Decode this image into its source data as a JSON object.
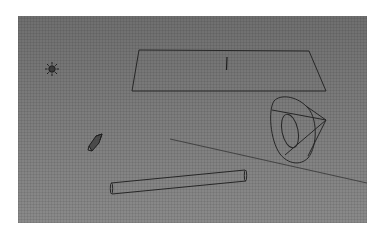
{
  "viewport": {
    "background": "#7c7c7c",
    "wire_color": "#2a2a2a",
    "objects": [
      {
        "name": "sun-lamp",
        "type": "light-sun",
        "center": [
          34,
          53
        ]
      },
      {
        "name": "plane",
        "type": "mesh-plane",
        "points": [
          [
            121,
            34
          ],
          [
            291,
            35
          ],
          [
            308,
            75
          ],
          [
            114,
            75
          ]
        ]
      },
      {
        "name": "spot-lamp",
        "type": "light-spot",
        "apex": [
          308,
          104
        ]
      },
      {
        "name": "camera",
        "type": "camera",
        "center": [
          76,
          126
        ]
      },
      {
        "name": "cylinder",
        "type": "mesh-cylinder",
        "from": [
          93,
          172
        ],
        "to": [
          227,
          159
        ]
      },
      {
        "name": "x-axis",
        "type": "axis-line",
        "from": [
          152,
          123
        ],
        "to": [
          349,
          167
        ]
      }
    ]
  }
}
